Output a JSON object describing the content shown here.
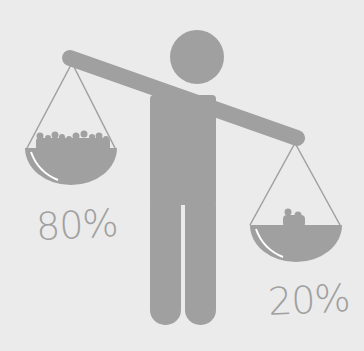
{
  "illustration": {
    "subject": "person-holding-balance-scale",
    "colors": {
      "background": "#ebebeb",
      "figure": "#a0a0a0",
      "highlight": "#ffffff"
    },
    "left_pan": {
      "label": "80%",
      "content": "crowd-of-people"
    },
    "right_pan": {
      "label": "20%",
      "content": "small-group-of-people"
    }
  }
}
